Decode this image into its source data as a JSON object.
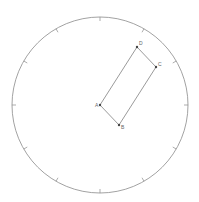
{
  "diagram": {
    "circle": {
      "cx": 100,
      "cy": 105,
      "r": 88,
      "stroke": "#8a8a8a",
      "tick_count": 12,
      "tick_length": 4
    },
    "rectangle": {
      "stroke": "#8f8f8f",
      "points": [
        {
          "name": "A",
          "x": 100,
          "y": 105,
          "label_dx": -5,
          "label_dy": 2
        },
        {
          "name": "B",
          "x": 119,
          "y": 125,
          "label_dx": 2,
          "label_dy": 4
        },
        {
          "name": "C",
          "x": 156,
          "y": 67,
          "label_dx": 2,
          "label_dy": -1
        },
        {
          "name": "D",
          "x": 137,
          "y": 47,
          "label_dx": 2,
          "label_dy": -2
        }
      ]
    },
    "point_color": "#444444"
  }
}
